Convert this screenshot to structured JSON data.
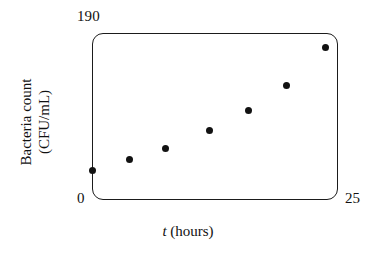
{
  "chart_data": {
    "type": "scatter",
    "title": "",
    "xlabel": "t (hours)",
    "ylabel": "Bacteria count (CFU/mL)",
    "ylabel_line1": "Bacteria count",
    "ylabel_line2": "(CFU/mL)",
    "xlabel_symbol": "t",
    "xlabel_unit": "(hours)",
    "xlim": [
      0,
      25
    ],
    "ylim": [
      0,
      190
    ],
    "x_tick_labels": [
      "0",
      "25"
    ],
    "y_tick_labels": [
      "0",
      "190"
    ],
    "x_min_label": "0",
    "x_max_label": "25",
    "y_min_label": "0",
    "y_max_label": "190",
    "grid": false,
    "legend": null,
    "marker": "filled-circle",
    "marker_color": "#121212",
    "frame_color": "#1b1b1b",
    "x": [
      0.0,
      3.8,
      7.5,
      11.9,
      15.9,
      19.8,
      23.7
    ],
    "values": [
      34,
      46,
      59,
      79,
      102,
      130,
      173
    ],
    "points": [
      {
        "t": 0.0,
        "count": 34
      },
      {
        "t": 3.8,
        "count": 46
      },
      {
        "t": 7.5,
        "count": 59
      },
      {
        "t": 11.9,
        "count": 79
      },
      {
        "t": 15.9,
        "count": 102
      },
      {
        "t": 19.8,
        "count": 130
      },
      {
        "t": 23.7,
        "count": 173
      }
    ]
  }
}
